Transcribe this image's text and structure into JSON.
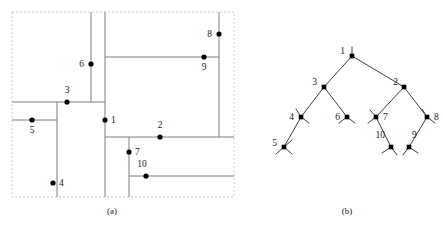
{
  "figure": {
    "panels": [
      {
        "id": "a",
        "caption": "(a)",
        "kind": "slicing-floorplan"
      },
      {
        "id": "b",
        "caption": "(b)",
        "kind": "binary-slicing-tree"
      }
    ],
    "colors": {
      "line": "#808080",
      "border_dashed": "#c8c8c8",
      "node": "#000000",
      "tree_edge": "#3a3a3a",
      "label": "#1a1a1a",
      "background": "#ffffff"
    }
  },
  "floorplan": {
    "panel_label": "(a)",
    "bounds": {
      "x": 12,
      "y": 12,
      "width": 222,
      "height": 185
    },
    "cut_labels": [
      "1",
      "2",
      "3",
      "4",
      "5",
      "6",
      "7",
      "8",
      "9",
      "10"
    ],
    "cuts": [
      {
        "label": "1",
        "dot_x": 105,
        "dot_y": 120,
        "text_x": 111,
        "text_y": 120,
        "orientation": "vertical",
        "align": "left"
      },
      {
        "label": "2",
        "dot_x": 160,
        "dot_y": 137,
        "text_x": 160,
        "text_y": 128,
        "orientation": "horizontal",
        "align": "above"
      },
      {
        "label": "3",
        "dot_x": 67,
        "dot_y": 102,
        "text_x": 67,
        "text_y": 93,
        "orientation": "horizontal",
        "align": "above"
      },
      {
        "label": "4",
        "dot_x": 53,
        "dot_y": 183,
        "text_x": 59,
        "text_y": 183,
        "orientation": "vertical",
        "align": "left"
      },
      {
        "label": "5",
        "dot_x": 32,
        "dot_y": 120,
        "text_x": 32,
        "text_y": 130,
        "orientation": "horizontal",
        "align": "below"
      },
      {
        "label": "6",
        "dot_x": 91,
        "dot_y": 64,
        "text_x": 84,
        "text_y": 64,
        "orientation": "vertical",
        "align": "right"
      },
      {
        "label": "7",
        "dot_x": 129,
        "dot_y": 152,
        "text_x": 135,
        "text_y": 152,
        "orientation": "vertical",
        "align": "left"
      },
      {
        "label": "8",
        "dot_x": 219,
        "dot_y": 34,
        "text_x": 212,
        "text_y": 34,
        "orientation": "vertical",
        "align": "right"
      },
      {
        "label": "9",
        "dot_x": 204,
        "dot_y": 57,
        "text_x": 204,
        "text_y": 67,
        "orientation": "horizontal",
        "align": "below"
      },
      {
        "label": "10",
        "dot_x": 146,
        "dot_y": 176,
        "text_x": 142,
        "text_y": 167,
        "orientation": "horizontal",
        "align": "above"
      }
    ],
    "segments": [
      {
        "name": "cut-1-vertical",
        "x1": 105,
        "y1": 12,
        "x2": 105,
        "y2": 197
      },
      {
        "name": "cut-3-horizontal",
        "x1": 12,
        "y1": 102,
        "x2": 105,
        "y2": 102
      },
      {
        "name": "cut-6-vertical",
        "x1": 91,
        "y1": 12,
        "x2": 91,
        "y2": 102
      },
      {
        "name": "cut-5-horizontal",
        "x1": 12,
        "y1": 120,
        "x2": 57,
        "y2": 120
      },
      {
        "name": "cut-4-vertical",
        "x1": 57,
        "y1": 102,
        "x2": 57,
        "y2": 197
      },
      {
        "name": "cut-2-horizontal",
        "x1": 105,
        "y1": 137,
        "x2": 234,
        "y2": 137
      },
      {
        "name": "cut-8-vertical",
        "x1": 219,
        "y1": 12,
        "x2": 219,
        "y2": 137
      },
      {
        "name": "cut-9-horizontal",
        "x1": 105,
        "y1": 57,
        "x2": 219,
        "y2": 57
      },
      {
        "name": "cut-7-vertical",
        "x1": 129,
        "y1": 137,
        "x2": 129,
        "y2": 197
      },
      {
        "name": "cut-10-horizontal",
        "x1": 129,
        "y1": 176,
        "x2": 234,
        "y2": 176
      }
    ]
  },
  "tree": {
    "panel_label": "(b)",
    "type": "binary-slicing-tree",
    "root": "1",
    "nodes": [
      {
        "label": "1",
        "x": 352,
        "y": 56,
        "text_x": 345,
        "text_y": 51,
        "label_side": "left"
      },
      {
        "label": "3",
        "x": 324,
        "y": 87,
        "text_x": 317,
        "text_y": 82,
        "label_side": "left"
      },
      {
        "label": "2",
        "x": 404,
        "y": 87,
        "text_x": 398,
        "text_y": 82,
        "label_side": "left"
      },
      {
        "label": "4",
        "x": 301,
        "y": 117,
        "text_x": 294,
        "text_y": 117,
        "label_side": "left"
      },
      {
        "label": "6",
        "x": 347,
        "y": 117,
        "text_x": 340,
        "text_y": 117,
        "label_side": "left"
      },
      {
        "label": "7",
        "x": 376,
        "y": 117,
        "text_x": 383,
        "text_y": 117,
        "label_side": "right"
      },
      {
        "label": "8",
        "x": 427,
        "y": 117,
        "text_x": 434,
        "text_y": 117,
        "label_side": "right"
      },
      {
        "label": "5",
        "x": 284,
        "y": 147,
        "text_x": 277,
        "text_y": 143,
        "label_side": "left"
      },
      {
        "label": "10",
        "x": 391,
        "y": 147,
        "text_x": 385,
        "text_y": 138,
        "label_side": "above-left"
      },
      {
        "label": "9",
        "x": 409,
        "y": 147,
        "text_x": 412,
        "text_y": 138,
        "label_side": "above-right"
      }
    ],
    "edges": [
      {
        "from": "1",
        "to": "3"
      },
      {
        "from": "1",
        "to": "2"
      },
      {
        "from": "3",
        "to": "4"
      },
      {
        "from": "3",
        "to": "6"
      },
      {
        "from": "2",
        "to": "7"
      },
      {
        "from": "2",
        "to": "8"
      },
      {
        "from": "4",
        "to": "5"
      },
      {
        "from": "7",
        "to": "10"
      },
      {
        "from": "8",
        "to": "9"
      }
    ],
    "leaf_stubs": [
      {
        "node": "1",
        "dx": 0,
        "dy": -9
      },
      {
        "node": "4",
        "dx": -5,
        "dy": -8
      },
      {
        "node": "4",
        "dx": 8,
        "dy": 6
      },
      {
        "node": "6",
        "dx": -8,
        "dy": 6
      },
      {
        "node": "6",
        "dx": 8,
        "dy": 6
      },
      {
        "node": "7",
        "dx": -6,
        "dy": -7
      },
      {
        "node": "7",
        "dx": -8,
        "dy": 6
      },
      {
        "node": "8",
        "dx": -5,
        "dy": -8
      },
      {
        "node": "8",
        "dx": 8,
        "dy": 6
      },
      {
        "node": "5",
        "dx": 8,
        "dy": -7
      },
      {
        "node": "5",
        "dx": -8,
        "dy": 7
      },
      {
        "node": "5",
        "dx": 8,
        "dy": 7
      },
      {
        "node": "10",
        "dx": -9,
        "dy": 6
      },
      {
        "node": "10",
        "dx": 6,
        "dy": 8
      },
      {
        "node": "9",
        "dx": -6,
        "dy": 8
      },
      {
        "node": "9",
        "dx": 9,
        "dy": 6
      }
    ]
  }
}
